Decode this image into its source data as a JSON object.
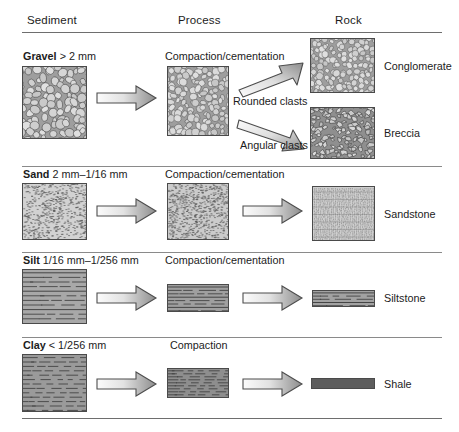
{
  "headers": {
    "sediment": "Sediment",
    "process": "Process",
    "rock": "Rock"
  },
  "rows": [
    {
      "id": "gravel",
      "name": "Gravel",
      "range": "> 2 mm",
      "process": "Compaction/cementation",
      "branch_labels": [
        "Rounded clasts",
        "Angular clasts"
      ],
      "rocks": [
        "Conglomerate",
        "Breccia"
      ]
    },
    {
      "id": "sand",
      "name": "Sand",
      "range": "2 mm–1/16 mm",
      "process": "Compaction/cementation",
      "branch_labels": [],
      "rocks": [
        "Sandstone"
      ]
    },
    {
      "id": "silt",
      "name": "Silt",
      "range": "1/16 mm–1/256 mm",
      "process": "Compaction/cementation",
      "branch_labels": [],
      "rocks": [
        "Siltstone"
      ]
    },
    {
      "id": "clay",
      "name": "Clay",
      "range": "< 1/256 mm",
      "process": "Compaction",
      "branch_labels": [],
      "rocks": [
        "Shale"
      ]
    }
  ],
  "icons": {
    "arrow": "right-block-arrow-icon",
    "arrow_up": "diagonal-up-block-arrow-icon",
    "arrow_down": "diagonal-down-block-arrow-icon"
  },
  "colors": {
    "rule": "#6e6e6e",
    "text": "#1c1c1c",
    "box_border": "#4a4a4a",
    "gravel_fill": "#c6c6c6",
    "clast_fill": "#d2d2d2",
    "sand_fill": "#cccccc",
    "silt_fill": "#a9a9a9",
    "clay_fill": "#9c9c9c",
    "shale_fill": "#5d5d5d",
    "arrow_light": "#f2f2f2",
    "arrow_dark": "#888888"
  }
}
